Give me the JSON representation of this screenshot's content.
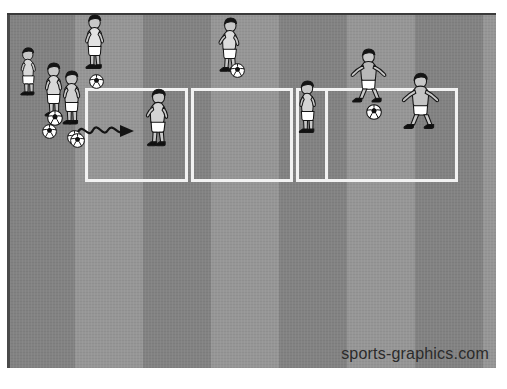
{
  "image": {
    "title": "Soccer dribbling grid drill diagram",
    "width": 507,
    "height": 389,
    "background_color": "#ffffff"
  },
  "watermark": {
    "text": "sports-graphics.com",
    "color": "#2b2b2b"
  },
  "pitch": {
    "name": "grass-pitch",
    "x": 7,
    "y": 13,
    "width": 489,
    "height": 355,
    "base_color": "#8a8a8a",
    "stripe_dark_color": "#828282",
    "stripe_light_color": "#969696",
    "stripe_width": 68,
    "stripe_count": 8,
    "top_edge_color": "#3a3a3a"
  },
  "grid": {
    "name": "drill-grid",
    "x": 85,
    "y": 88,
    "width": 373,
    "height": 94,
    "line_color": "#f2f2f2",
    "line_width": 3,
    "cells": [
      {
        "label": "cell-1",
        "x": 0,
        "width": 103
      },
      {
        "label": "cell-2",
        "x": 106,
        "width": 102
      },
      {
        "label": "cell-3",
        "x": 211,
        "width": 32
      },
      {
        "label": "cell-4",
        "x": 240,
        "width": 133
      }
    ]
  },
  "arrow": {
    "name": "dribble-path-arrow",
    "description": "wavy dribbling arrow pointing right into the first grid square",
    "color": "#141414",
    "start_x": 76,
    "start_y": 118,
    "length": 58
  },
  "players": [
    {
      "id": "p1",
      "name": "player-queue-back",
      "x": 14,
      "y": 47,
      "scale": 0.86,
      "pose": "standing-left",
      "shirt": "#d8d8d8",
      "shorts": "#ffffff",
      "skin": "#c8c8c8",
      "hair": "#151515",
      "boots": "#101010"
    },
    {
      "id": "p2",
      "name": "player-queue-middle",
      "x": 37,
      "y": 62,
      "scale": 0.92,
      "pose": "standing-front",
      "shirt": "#d8d8d8",
      "shorts": "#ffffff",
      "skin": "#c8c8c8",
      "hair": "#151515",
      "boots": "#101010"
    },
    {
      "id": "p3",
      "name": "player-queue-front",
      "x": 55,
      "y": 70,
      "scale": 0.92,
      "pose": "standing-front",
      "shirt": "#d0d0d0",
      "shorts": "#ffffff",
      "skin": "#c8c8c8",
      "hair": "#151515",
      "boots": "#101010"
    },
    {
      "id": "p4",
      "name": "player-top-left",
      "x": 78,
      "y": 14,
      "scale": 0.92,
      "pose": "standing-ball",
      "shirt": "#e2e2e2",
      "shorts": "#ffffff",
      "skin": "#c8c8c8",
      "hair": "#151515",
      "boots": "#101010"
    },
    {
      "id": "p5",
      "name": "player-top-center",
      "x": 211,
      "y": 17,
      "scale": 0.92,
      "pose": "dribbling-right",
      "shirt": "#dcdcdc",
      "shorts": "#ffffff",
      "skin": "#c8c8c8",
      "hair": "#151515",
      "boots": "#101010"
    },
    {
      "id": "p6",
      "name": "player-in-cell-1",
      "x": 138,
      "y": 88,
      "scale": 0.98,
      "pose": "dribbling-right",
      "shirt": "#d4d4d4",
      "shorts": "#ffffff",
      "skin": "#c8c8c8",
      "hair": "#151515",
      "boots": "#101010"
    },
    {
      "id": "p7",
      "name": "player-in-cell-2-right",
      "x": 292,
      "y": 80,
      "scale": 0.94,
      "pose": "standing-left",
      "shirt": "#d4d4d4",
      "shorts": "#ffffff",
      "skin": "#c8c8c8",
      "hair": "#151515",
      "boots": "#101010"
    },
    {
      "id": "p8",
      "name": "player-top-right",
      "x": 345,
      "y": 48,
      "scale": 0.94,
      "pose": "defending-stance",
      "shirt": "#b8b8b8",
      "shorts": "#ffffff",
      "skin": "#c8c8c8",
      "hair": "#151515",
      "boots": "#101010"
    },
    {
      "id": "p9",
      "name": "player-in-cell-4",
      "x": 396,
      "y": 72,
      "scale": 0.98,
      "pose": "defending-stance",
      "shirt": "#c4c4c4",
      "shorts": "#ffffff",
      "skin": "#c8c8c8",
      "hair": "#151515",
      "boots": "#101010"
    }
  ],
  "balls": [
    {
      "id": "b1",
      "name": "soccer-ball-queue-a",
      "x": 47,
      "y": 110,
      "size": 16
    },
    {
      "id": "b2",
      "name": "soccer-ball-queue-b",
      "x": 42,
      "y": 124,
      "size": 15
    },
    {
      "id": "b3",
      "name": "soccer-ball-queue-c",
      "x": 67,
      "y": 130,
      "size": 15
    },
    {
      "id": "b4",
      "name": "soccer-ball-dribble",
      "x": 70,
      "y": 133,
      "size": 15
    },
    {
      "id": "b5",
      "name": "soccer-ball-top-left",
      "x": 89,
      "y": 74,
      "size": 15
    },
    {
      "id": "b6",
      "name": "soccer-ball-top-center",
      "x": 230,
      "y": 63,
      "size": 15
    },
    {
      "id": "b7",
      "name": "soccer-ball-top-right",
      "x": 366,
      "y": 104,
      "size": 16
    }
  ],
  "colors": {
    "grass": "#8a8a8a",
    "line": "#f2f2f2",
    "ink": "#141414",
    "page": "#ffffff"
  }
}
